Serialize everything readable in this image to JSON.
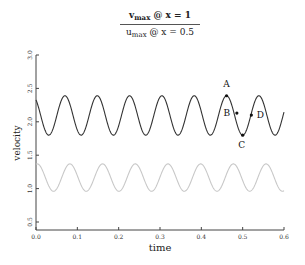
{
  "chart_data": {
    "type": "line",
    "title": {
      "numerator": {
        "var": "v",
        "sub": "max",
        "rest": " @ x = 1"
      },
      "denominator": {
        "var": "u",
        "sub": "max",
        "rest": " @ x = 0.5"
      }
    },
    "xlabel": "time",
    "ylabel": "velocity",
    "xlim": [
      0.0,
      0.6
    ],
    "ylim": [
      0.5,
      3.0
    ],
    "xticks": [
      "0.0",
      "0.1",
      "0.2",
      "0.3",
      "0.4",
      "0.5",
      "0.6"
    ],
    "yticks": [
      "0.5",
      "1.0",
      "1.5",
      "2.0",
      "2.5",
      "3.0"
    ],
    "grid": false,
    "series": [
      {
        "name": "v_max @ x = 1",
        "color": "#333333",
        "model": "mean + amp*cos(2*pi*(t - phase)/period)",
        "mean": 2.095,
        "amp": 0.295,
        "period": 0.0782,
        "phase": 0.07,
        "approx_points": [
          [
            0.0,
            2.38
          ],
          [
            0.035,
            1.8
          ],
          [
            0.07,
            2.39
          ],
          [
            0.109,
            1.8
          ],
          [
            0.148,
            2.39
          ],
          [
            0.187,
            1.8
          ],
          [
            0.226,
            2.39
          ],
          [
            0.265,
            1.8
          ],
          [
            0.304,
            2.39
          ],
          [
            0.343,
            1.8
          ],
          [
            0.382,
            2.39
          ],
          [
            0.421,
            1.8
          ],
          [
            0.461,
            2.39
          ],
          [
            0.5,
            1.8
          ],
          [
            0.539,
            2.39
          ],
          [
            0.6,
            2.0
          ]
        ]
      },
      {
        "name": "u_max @ x = 0.5",
        "color": "#c8c8c8",
        "model": "mean + amp*cos(2*pi*(t - phase)/period)",
        "mean": 1.165,
        "amp": 0.205,
        "period": 0.0791,
        "phase": 0.082,
        "approx_points": [
          [
            0.0,
            1.37
          ],
          [
            0.042,
            0.96
          ],
          [
            0.082,
            1.37
          ],
          [
            0.121,
            0.96
          ],
          [
            0.161,
            1.37
          ],
          [
            0.2,
            0.96
          ],
          [
            0.24,
            1.37
          ],
          [
            0.28,
            0.96
          ],
          [
            0.319,
            1.37
          ],
          [
            0.359,
            0.96
          ],
          [
            0.398,
            1.37
          ],
          [
            0.438,
            0.96
          ],
          [
            0.477,
            1.37
          ],
          [
            0.517,
            0.96
          ],
          [
            0.556,
            1.37
          ],
          [
            0.6,
            1.05
          ]
        ]
      }
    ],
    "annotations": [
      {
        "label": "A",
        "t": 0.461,
        "v": 2.39,
        "desc": "peak"
      },
      {
        "label": "B",
        "t": 0.486,
        "v": 2.13,
        "desc": "descending midpoint"
      },
      {
        "label": "C",
        "t": 0.5,
        "v": 1.8,
        "desc": "trough"
      },
      {
        "label": "D",
        "t": 0.521,
        "v": 2.1,
        "desc": "ascending midpoint"
      }
    ]
  }
}
